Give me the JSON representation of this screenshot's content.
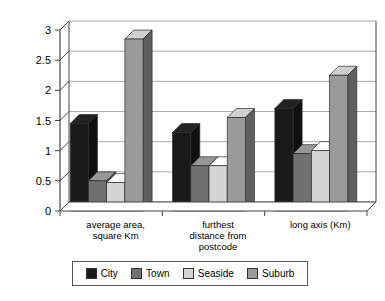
{
  "chart_data": {
    "type": "bar",
    "title": "",
    "subtitle": "",
    "xlabel": "",
    "ylabel": "",
    "categories": [
      "average area, square Km",
      "furthest distance from postcode",
      "long axis (Km)"
    ],
    "category_lines": [
      [
        "average area,",
        "square Km"
      ],
      [
        "furthest",
        "distance from",
        "postcode"
      ],
      [
        "long axis (Km)"
      ]
    ],
    "series": [
      {
        "name": "City",
        "color": "#1a1a1a",
        "values": [
          1.45,
          1.3,
          1.7
        ]
      },
      {
        "name": "Town",
        "color": "#707070",
        "values": [
          0.5,
          0.75,
          0.95
        ]
      },
      {
        "name": "Seaside",
        "color": "#d4d4d4",
        "values": [
          0.47,
          0.75,
          1.0
        ]
      },
      {
        "name": "Suburb",
        "color": "#9a9a9a",
        "values": [
          2.85,
          1.55,
          2.25
        ]
      }
    ],
    "ylim": [
      0,
      3
    ],
    "yticks": [
      0,
      0.5,
      1,
      1.5,
      2,
      2.5,
      3
    ],
    "ytick_labels": [
      "0",
      "0.5",
      "1",
      "1.5",
      "2",
      "2.5",
      "3"
    ],
    "grid": true,
    "grid_axis": "y",
    "legend_position": "bottom",
    "style": "3d-column",
    "plot_background": "#ffffff",
    "axis_color": "#444444",
    "grid_color": "#aaaaaa"
  },
  "legend": {
    "items": [
      {
        "label": "City",
        "color": "#1a1a1a"
      },
      {
        "label": "Town",
        "color": "#707070"
      },
      {
        "label": "Seaside",
        "color": "#d4d4d4"
      },
      {
        "label": "Suburb",
        "color": "#9a9a9a"
      }
    ]
  }
}
